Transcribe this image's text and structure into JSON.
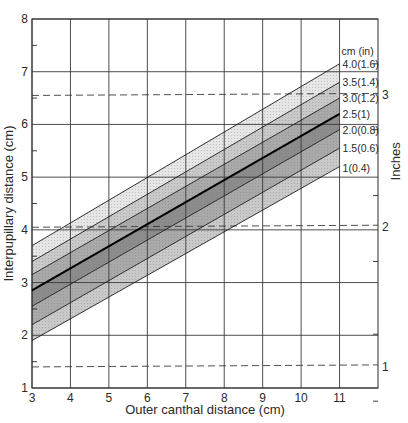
{
  "chart_data": {
    "type": "area",
    "title": "",
    "xlabel": "Outer canthal distance (cm)",
    "ylabel": "Interpupillary distance (cm)",
    "y2label": "Inches",
    "xlim": [
      3,
      12
    ],
    "ylim": [
      1,
      8
    ],
    "x_ticks": [
      3,
      4,
      5,
      6,
      7,
      8,
      9,
      10,
      11
    ],
    "y_ticks": [
      1,
      2,
      3,
      4,
      5,
      6,
      7,
      8
    ],
    "y2_ticks": [
      {
        "label": "1",
        "cm": 1.4
      },
      {
        "label": "2",
        "cm": 4.05
      },
      {
        "label": "3",
        "cm": 6.55
      }
    ],
    "grid": true,
    "legend_header": "cm (in)",
    "center_line": {
      "x": [
        3,
        11
      ],
      "y": [
        2.85,
        6.2
      ]
    },
    "series": [
      {
        "name": "4.0(1.6)",
        "x": [
          3,
          11
        ],
        "y": [
          3.7,
          7.15
        ]
      },
      {
        "name": "3.5(1.4)",
        "x": [
          3,
          11
        ],
        "y": [
          3.4,
          6.8
        ]
      },
      {
        "name": "3.0(1.2)",
        "x": [
          3,
          11
        ],
        "y": [
          3.15,
          6.5
        ]
      },
      {
        "name": "2.5(1)",
        "x": [
          3,
          11
        ],
        "y": [
          2.85,
          6.2
        ]
      },
      {
        "name": "2.0(0.8)",
        "x": [
          3,
          11
        ],
        "y": [
          2.55,
          5.9
        ]
      },
      {
        "name": "1.5(0.6)",
        "x": [
          3,
          11
        ],
        "y": [
          2.2,
          5.55
        ]
      },
      {
        "name": "1(0.4)",
        "x": [
          3,
          11
        ],
        "y": [
          1.9,
          5.2
        ]
      }
    ],
    "band_fills": [
      "#e6e6e6",
      "#c9c9c9",
      "#a9a9a9",
      "#8c8c8c",
      "#a9a9a9",
      "#c9c9c9",
      "#e6e6e6"
    ],
    "dashed_lines_cm": [
      1.4,
      4.05,
      6.55
    ]
  }
}
